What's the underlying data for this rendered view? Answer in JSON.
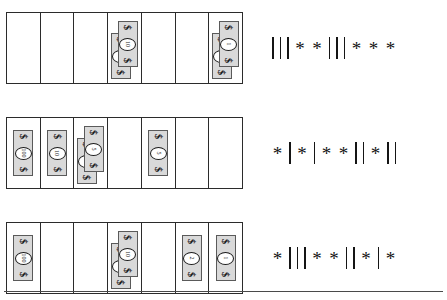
{
  "worksheet": {
    "grid_columns": 7,
    "row_count": 3,
    "bill_symbol": "$",
    "rows": [
      {
        "row_label": "row-1",
        "cells": [
          {
            "index": 1,
            "bills": []
          },
          {
            "index": 2,
            "bills": []
          },
          {
            "index": 3,
            "bills": []
          },
          {
            "index": 4,
            "bills": [
              {
                "denom": "10"
              },
              {
                "denom": "10"
              }
            ]
          },
          {
            "index": 5,
            "bills": []
          },
          {
            "index": 6,
            "bills": []
          },
          {
            "index": 7,
            "bills": [
              {
                "denom": "1"
              },
              {
                "denom": "1"
              }
            ]
          }
        ],
        "marks": [
          "bar",
          "bar",
          "bar",
          "star",
          "star",
          "bar",
          "bar",
          "bar",
          "star",
          "star",
          "star"
        ],
        "marks_text": "| | | * * | | | * * *"
      },
      {
        "row_label": "row-2",
        "cells": [
          {
            "index": 1,
            "bills": [
              {
                "denom": "100"
              }
            ]
          },
          {
            "index": 2,
            "bills": [
              {
                "denom": "10"
              }
            ]
          },
          {
            "index": 3,
            "bills": [
              {
                "denom": "5"
              },
              {
                "denom": "5"
              }
            ]
          },
          {
            "index": 4,
            "bills": []
          },
          {
            "index": 5,
            "bills": [
              {
                "denom": "5"
              }
            ]
          },
          {
            "index": 6,
            "bills": []
          },
          {
            "index": 7,
            "bills": []
          }
        ],
        "marks": [
          "star",
          "bar",
          "star",
          "bar",
          "star",
          "star",
          "bar",
          "bar",
          "star",
          "bar",
          "bar"
        ],
        "marks_text": "* | * | * * | | * | |"
      },
      {
        "row_label": "row-3",
        "cells": [
          {
            "index": 1,
            "bills": [
              {
                "denom": "100"
              }
            ]
          },
          {
            "index": 2,
            "bills": []
          },
          {
            "index": 3,
            "bills": []
          },
          {
            "index": 4,
            "bills": [
              {
                "denom": "10"
              },
              {
                "denom": "10"
              }
            ]
          },
          {
            "index": 5,
            "bills": []
          },
          {
            "index": 6,
            "bills": [
              {
                "denom": "2"
              }
            ]
          },
          {
            "index": 7,
            "bills": [
              {
                "denom": "1"
              }
            ]
          }
        ],
        "marks": [
          "star",
          "bar",
          "bar",
          "bar",
          "star",
          "star",
          "bar",
          "bar",
          "star",
          "bar",
          "star"
        ],
        "marks_text": "* | | | * * | | * | *"
      }
    ],
    "colors": {
      "bill_fill": "#d9d9d9",
      "bill_border": "#5a5a5a",
      "grid_border": "#2b2b2b",
      "ink": "#151515",
      "background": "#ffffff"
    }
  }
}
